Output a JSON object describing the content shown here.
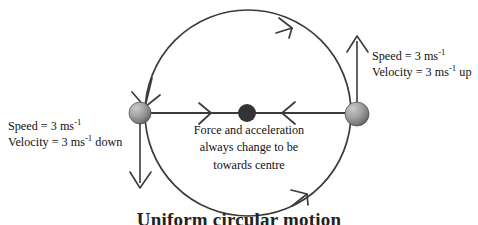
{
  "diagram": {
    "title": "Uniform circular motion",
    "caption": "Uniform circular motion",
    "geometry": {
      "circle_center_x": 248,
      "circle_center_y": 113,
      "circle_radius": 103,
      "rotation_sense": "clockwise"
    },
    "colors": {
      "stroke": "#3b3b3b",
      "text": "#111111",
      "centre_dot": "#333333",
      "ball_light": "#b9b9b9",
      "ball_dark": "#5a5a5a",
      "background": "#ffffff"
    },
    "labels": {
      "right": {
        "name": "right-velocity-label",
        "line1_prefix": "Speed = 3 ms",
        "line1_sup": "-1",
        "line1_suffix": "",
        "line2_prefix": "Velocity = 3 ms",
        "line2_sup": "-1",
        "line2_suffix": " up"
      },
      "left": {
        "name": "left-velocity-label",
        "line1_prefix": "Speed = 3 ms",
        "line1_sup": "-1",
        "line1_suffix": "",
        "line2_prefix": "Velocity = 3 ms",
        "line2_sup": "-1",
        "line2_suffix": " down"
      },
      "centre": {
        "name": "centre-force-label",
        "line1": "Force and acceleration",
        "line2": "always change to be",
        "line3": "towards centre"
      }
    },
    "objects": {
      "left_ball": {
        "cx": 140,
        "cy": 113,
        "r": 11
      },
      "right_ball": {
        "cx": 357,
        "cy": 114,
        "r": 12
      },
      "centre_dot": {
        "cx": 247,
        "cy": 113,
        "r": 9
      }
    },
    "vectors": {
      "left_velocity": {
        "direction": "down",
        "from_y": 113,
        "to_y": 186
      },
      "right_velocity": {
        "direction": "up",
        "from_y": 114,
        "to_y": 36
      },
      "force_left": {
        "direction": "right",
        "label": "towards centre"
      },
      "force_right": {
        "direction": "left",
        "label": "towards centre"
      }
    }
  }
}
